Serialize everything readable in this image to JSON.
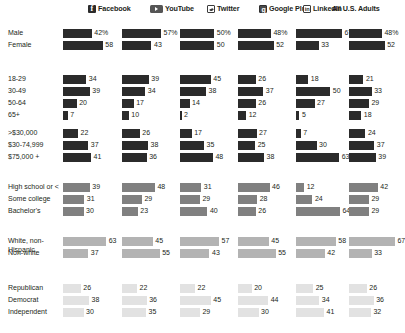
{
  "chart_data": {
    "type": "bar",
    "title": "",
    "xlabel": "",
    "ylabel": "",
    "xlim": [
      0,
      70
    ],
    "grid": false,
    "legend_position": "top",
    "note": "Percent of U.S. adults in each demographic group who use each social media platform; horizontal bars per cell.",
    "columns": [
      {
        "key": "facebook",
        "label": "Facebook",
        "icon": "facebook-icon"
      },
      {
        "key": "youtube",
        "label": "YouTube",
        "icon": "youtube-icon"
      },
      {
        "key": "twitter",
        "label": "Twitter",
        "icon": "twitter-icon"
      },
      {
        "key": "googleplus",
        "label": "Google Plus",
        "icon": "google-plus-icon"
      },
      {
        "key": "linkedin",
        "label": "LinkedIn",
        "icon": "linkedin-icon"
      },
      {
        "key": "alladults",
        "label": "All U.S. Adults",
        "icon": "none"
      }
    ],
    "groups": [
      {
        "name": "gender",
        "shade": "#2b2b2b",
        "rows": [
          {
            "label": "Male",
            "values": [
              42,
              57,
              50,
              48,
              67,
              48
            ],
            "display": [
              "42%",
              "57%",
              "50%",
              "48%",
              "67%",
              "48%"
            ]
          },
          {
            "label": "Female",
            "values": [
              58,
              43,
              50,
              52,
              33,
              52
            ],
            "display": [
              "58",
              "43",
              "50",
              "52",
              "33",
              "52"
            ]
          }
        ]
      },
      {
        "name": "age",
        "shade": "#2b2b2b",
        "rows": [
          {
            "label": "18-29",
            "values": [
              34,
              39,
              45,
              26,
              18,
              21
            ],
            "display": [
              "34",
              "39",
              "45",
              "26",
              "18",
              "21"
            ]
          },
          {
            "label": "30-49",
            "values": [
              39,
              34,
              38,
              37,
              50,
              33
            ],
            "display": [
              "39",
              "34",
              "38",
              "37",
              "50",
              "33"
            ]
          },
          {
            "label": "50-64",
            "values": [
              20,
              17,
              14,
              26,
              27,
              29
            ],
            "display": [
              "20",
              "17",
              "14",
              "26",
              "27",
              "29"
            ]
          },
          {
            "label": "65+",
            "values": [
              7,
              10,
              2,
              12,
              5,
              18
            ],
            "display": [
              "7",
              "10",
              "2",
              "12",
              "5",
              "18"
            ]
          }
        ]
      },
      {
        "name": "income",
        "shade": "#2b2b2b",
        "rows": [
          {
            "label": ">$30,000",
            "values": [
              22,
              26,
              17,
              27,
              7,
              24
            ],
            "display": [
              "22",
              "26",
              "17",
              "27",
              "7",
              "24"
            ]
          },
          {
            "label": "$30-74,999",
            "values": [
              37,
              38,
              35,
              25,
              30,
              37
            ],
            "display": [
              "37",
              "38",
              "35",
              "25",
              "30",
              "37"
            ]
          },
          {
            "label": "$75,000 +",
            "values": [
              41,
              36,
              48,
              38,
              63,
              39
            ],
            "display": [
              "41",
              "36",
              "48",
              "38",
              "63",
              "39"
            ]
          }
        ]
      },
      {
        "name": "education",
        "shade": "#808080",
        "rows": [
          {
            "label": "High school or <",
            "values": [
              39,
              48,
              31,
              46,
              12,
              42
            ],
            "display": [
              "39",
              "48",
              "31",
              "46",
              "12",
              "42"
            ]
          },
          {
            "label": "Some college",
            "values": [
              31,
              29,
              29,
              28,
              24,
              29
            ],
            "display": [
              "31",
              "29",
              "29",
              "28",
              "24",
              "29"
            ]
          },
          {
            "label": "Bachelor's",
            "values": [
              30,
              23,
              40,
              26,
              64,
              29
            ],
            "display": [
              "30",
              "23",
              "40",
              "26",
              "64",
              "29"
            ]
          }
        ]
      },
      {
        "name": "race",
        "shade": "#b3b3b3",
        "rows": [
          {
            "label": "White, non-Hispanic",
            "values": [
              63,
              45,
              57,
              45,
              58,
              67
            ],
            "display": [
              "63",
              "45",
              "57",
              "45",
              "58",
              "67"
            ],
            "twoLine": true
          },
          {
            "label": "Non-white",
            "values": [
              37,
              55,
              43,
              55,
              42,
              33
            ],
            "display": [
              "37",
              "55",
              "43",
              "55",
              "42",
              "33"
            ]
          }
        ]
      },
      {
        "name": "politics",
        "shade": "#e2e2e2",
        "rows": [
          {
            "label": "Republican",
            "values": [
              26,
              22,
              22,
              20,
              25,
              26
            ],
            "display": [
              "26",
              "22",
              "22",
              "20",
              "25",
              "26"
            ]
          },
          {
            "label": "Democrat",
            "values": [
              38,
              36,
              45,
              44,
              34,
              36
            ],
            "display": [
              "38",
              "36",
              "45",
              "44",
              "34",
              "36"
            ]
          },
          {
            "label": "Independent",
            "values": [
              30,
              35,
              29,
              30,
              41,
              32
            ],
            "display": [
              "30",
              "35",
              "29",
              "30",
              "41",
              "32"
            ]
          }
        ]
      }
    ]
  }
}
